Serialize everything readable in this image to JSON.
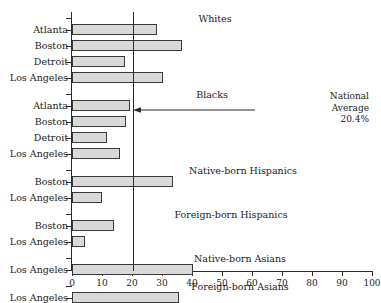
{
  "chart_data": {
    "type": "bar",
    "orientation": "horizontal",
    "title": "",
    "xlabel": "",
    "ylabel": "",
    "xlim": [
      0,
      100
    ],
    "xticks": [
      0,
      10,
      20,
      30,
      40,
      50,
      60,
      70,
      80,
      90,
      100
    ],
    "xtick_labels": [
      "0",
      "10",
      "20",
      "30",
      "40",
      "50",
      "60",
      "70",
      "80",
      "90",
      "100"
    ],
    "grid": false,
    "legend": "none",
    "bar_color": "#d9d9d9",
    "bar_edge_color": "#3a3a3a",
    "axis_color": "#2b2b2b",
    "groups": [
      {
        "heading": "Whites",
        "heading_x": 215,
        "categories": [
          "Atlanta",
          "Boston",
          "Detroit",
          "Los Angeles"
        ],
        "values": [
          28.3,
          36.7,
          17.7,
          30.3
        ]
      },
      {
        "heading": "Blacks",
        "heading_x": 212,
        "categories": [
          "Atlanta",
          "Boston",
          "Detroit",
          "Los Angeles"
        ],
        "values": [
          19.3,
          18.0,
          11.8,
          16.0
        ]
      },
      {
        "heading": "Native-born Hispanics",
        "heading_x": 243,
        "categories": [
          "Boston",
          "Los Angeles"
        ],
        "values": [
          33.6,
          10.1
        ]
      },
      {
        "heading": "Foreign-born Hispanics",
        "heading_x": 231,
        "categories": [
          "Boston",
          "Los Angeles"
        ],
        "values": [
          14.1,
          4.3
        ]
      },
      {
        "heading": "Native-born Asians",
        "heading_x": 240,
        "categories": [
          "Los Angeles"
        ],
        "values": [
          40.4
        ]
      },
      {
        "heading": "Foreign-born Asians",
        "heading_x": 240,
        "categories": [
          "Los Angeles"
        ],
        "values": [
          35.7
        ]
      }
    ],
    "annotations": [
      {
        "name": "national-average",
        "lines": [
          "National",
          "Average",
          "20.4%"
        ],
        "value": 20.4,
        "arrow": "left"
      }
    ]
  }
}
